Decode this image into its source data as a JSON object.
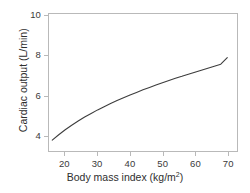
{
  "chart_data": {
    "type": "line",
    "title": "",
    "xlabel": "Body mass index (kg/m",
    "xlabel_sup": "2",
    "xlabel_tail": ")",
    "xlabel_full": "Body mass index (kg/m2)",
    "ylabel": "Cardiac output (L/min)",
    "xlim": [
      15,
      73
    ],
    "ylim": [
      3.2,
      10.1
    ],
    "xticks": [
      20,
      30,
      40,
      50,
      60,
      70
    ],
    "yticks": [
      4,
      6,
      8,
      10
    ],
    "xtick_labels": [
      "20",
      "30",
      "40",
      "50",
      "60",
      "70"
    ],
    "ytick_labels": [
      "4",
      "6",
      "8",
      "10"
    ],
    "grid": false,
    "legend": false,
    "series": [
      {
        "name": "Cardiac output vs BMI",
        "color": "#3d3d3d",
        "line_width": 1.1,
        "x": [
          16,
          18,
          20,
          22,
          24,
          26,
          28,
          30,
          32,
          34,
          36,
          38,
          40,
          42,
          44,
          46,
          48,
          50,
          52,
          54,
          56,
          58,
          60,
          62,
          64,
          66,
          68,
          70
        ],
        "y": [
          3.75,
          4.02,
          4.27,
          4.5,
          4.71,
          4.91,
          5.09,
          5.27,
          5.43,
          5.59,
          5.74,
          5.88,
          6.02,
          6.15,
          6.28,
          6.4,
          6.52,
          6.64,
          6.75,
          6.86,
          6.96,
          7.07,
          7.17,
          7.27,
          7.37,
          7.47,
          7.57,
          7.9
        ]
      }
    ]
  },
  "style": {
    "axis_color": "#b9b9b9",
    "tick_label_color": "#3a3a3a",
    "axis_title_color": "#2e2e2e",
    "background": "#ffffff"
  }
}
